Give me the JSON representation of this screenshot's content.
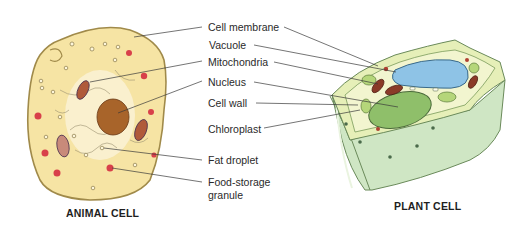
{
  "figure": {
    "animal_cell": {
      "title": "ANIMAL CELL",
      "colors": {
        "cytoplasm": "#f6e4a4",
        "membrane": "#a08a4a",
        "nucleus": "#a8642a",
        "food_granule": "#d8404a",
        "mitochondria": "#b05a3a"
      }
    },
    "plant_cell": {
      "title": "PLANT CELL",
      "colors": {
        "wall": "#cfe6c4",
        "cytoplasm": "#f2f5cf",
        "vacuole": "#8ec3e6",
        "chloroplast": "#8fbf6a",
        "mitochondria": "#8a3a28"
      }
    },
    "labels": [
      {
        "id": "cell-membrane",
        "text": "Cell membrane"
      },
      {
        "id": "vacuole",
        "text": "Vacuole"
      },
      {
        "id": "mitochondria",
        "text": "Mitochondria"
      },
      {
        "id": "nucleus",
        "text": "Nucleus"
      },
      {
        "id": "cell-wall",
        "text": "Cell wall"
      },
      {
        "id": "chloroplast",
        "text": "Chloroplast"
      },
      {
        "id": "fat-droplet",
        "text": "Fat droplet"
      },
      {
        "id": "food-storage-granule-line1",
        "text": "Food-storage"
      },
      {
        "id": "food-storage-granule-line2",
        "text": "granule"
      }
    ]
  }
}
